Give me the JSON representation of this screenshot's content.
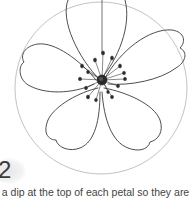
{
  "illustration": {
    "subject": "five-petal flower line drawing inside circle guide",
    "stroke_color": "#3a3a3a",
    "guide_color": "#9a9a9a"
  },
  "step": {
    "number": "2",
    "caption": "t a dip at the top of each petal so they are"
  }
}
